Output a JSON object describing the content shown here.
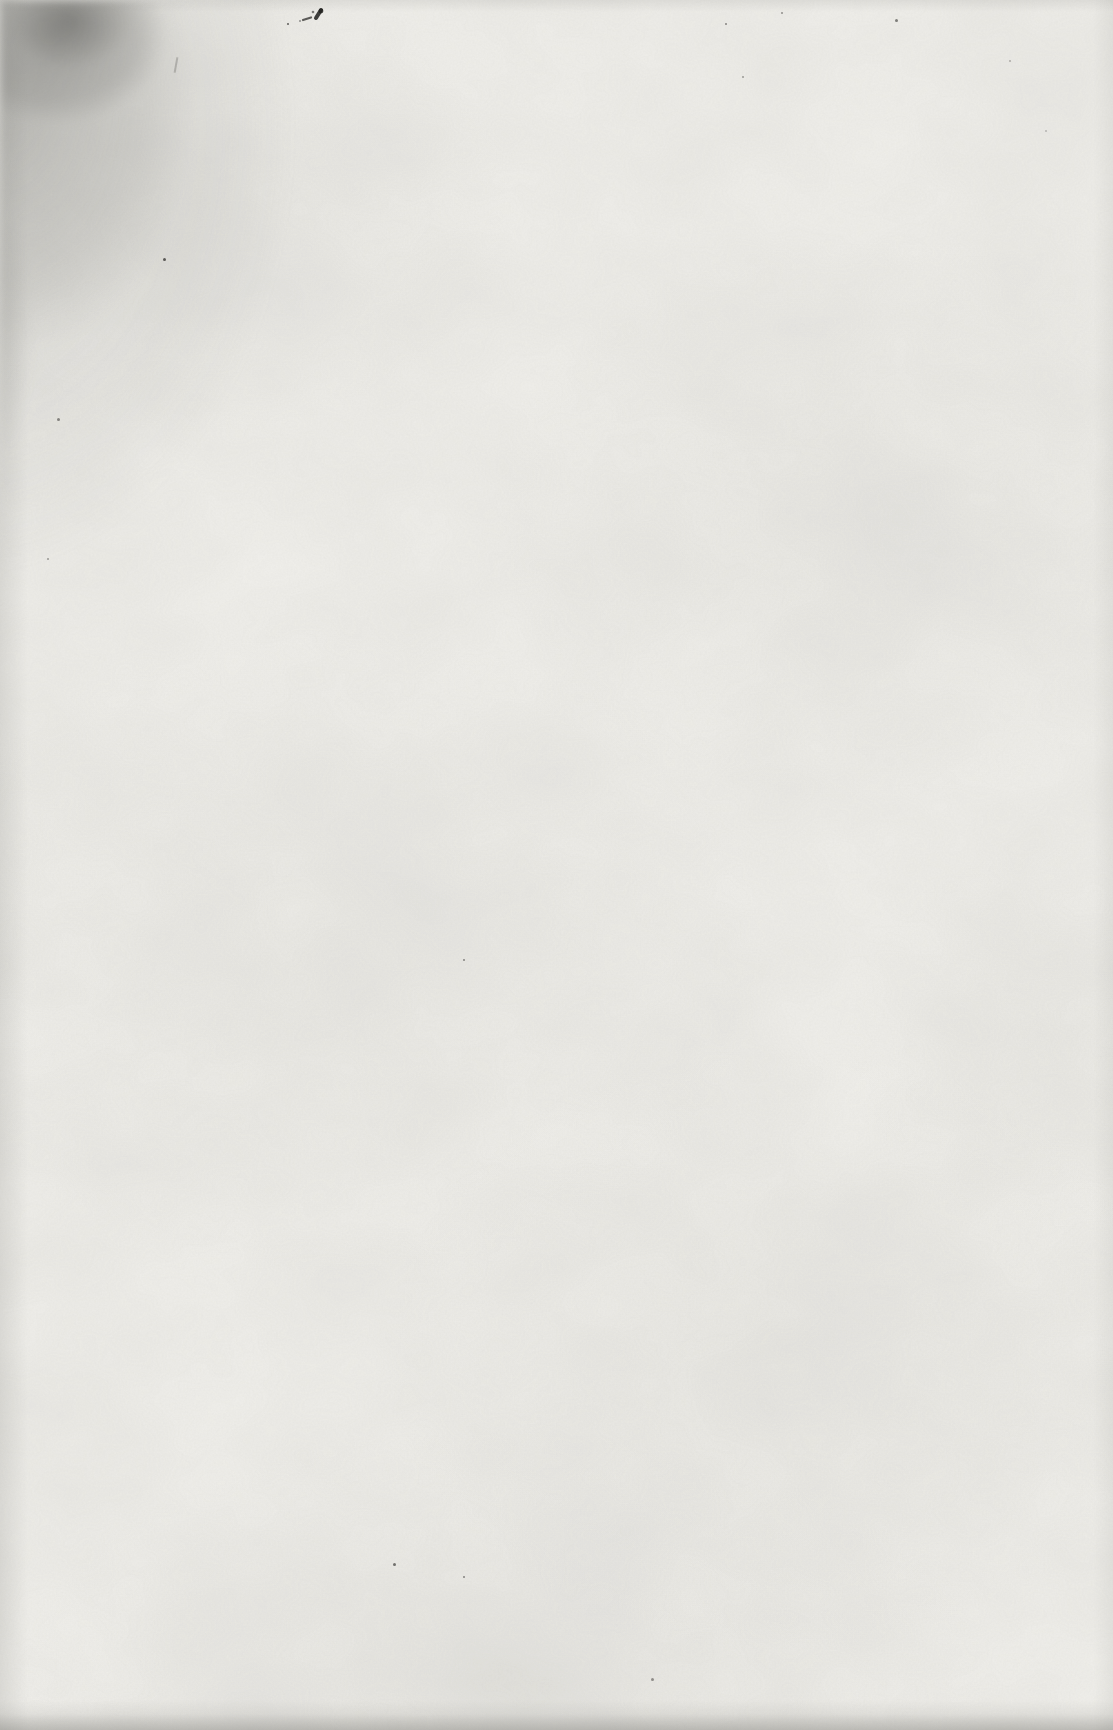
{
  "page": {
    "kind": "blank scanned book page",
    "text_content": "",
    "colors": {
      "paper": "#f1f0ec",
      "paper_light": "#f6f5f2",
      "mottle": "#deddd8",
      "edge_shade": "#7a7974",
      "smudge_dark": "#55544f",
      "smudge_mid": "#8a8a86",
      "ink": "#23221f"
    },
    "marks": {
      "corner_smudge": {
        "position": "top-left"
      },
      "ink_spatter": {
        "x": 275,
        "y": 2
      },
      "pencil_stroke": {
        "x": 175,
        "y": 57,
        "length": 16,
        "angle_deg": 10,
        "opacity": 0.3
      },
      "specks": [
        {
          "x": 163,
          "y": 258,
          "s": 3,
          "o": 0.7
        },
        {
          "x": 287,
          "y": 23,
          "s": 2,
          "o": 0.45
        },
        {
          "x": 725,
          "y": 23,
          "s": 2,
          "o": 0.5
        },
        {
          "x": 781,
          "y": 12,
          "s": 2,
          "o": 0.45
        },
        {
          "x": 895,
          "y": 19,
          "s": 3,
          "o": 0.55
        },
        {
          "x": 742,
          "y": 76,
          "s": 2,
          "o": 0.4
        },
        {
          "x": 57,
          "y": 418,
          "s": 3,
          "o": 0.5
        },
        {
          "x": 47,
          "y": 558,
          "s": 2,
          "o": 0.4
        },
        {
          "x": 463,
          "y": 959,
          "s": 2,
          "o": 0.5
        },
        {
          "x": 393,
          "y": 1563,
          "s": 3,
          "o": 0.6
        },
        {
          "x": 463,
          "y": 1576,
          "s": 2,
          "o": 0.5
        },
        {
          "x": 651,
          "y": 1678,
          "s": 3,
          "o": 0.45
        },
        {
          "x": 1009,
          "y": 60,
          "s": 2,
          "o": 0.3
        },
        {
          "x": 1045,
          "y": 130,
          "s": 2,
          "o": 0.25
        }
      ]
    }
  }
}
